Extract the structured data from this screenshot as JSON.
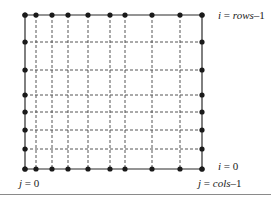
{
  "figure": {
    "type": "grid-lattice-diagram",
    "background_color": "#ffffff",
    "line_color": "#2b2b2b",
    "dashed_color": "#555555",
    "dot_color": "#1a1a1a",
    "dot_radius": 2.6,
    "solid_stroke_width": 1.2,
    "dashed_stroke_width": 1.0,
    "dash_pattern": "3,2",
    "bounds": {
      "left": 25,
      "top": 15,
      "right": 202,
      "bottom": 169
    },
    "column_x": [
      25,
      36,
      52,
      68,
      88,
      110,
      125,
      152,
      180,
      202
    ],
    "row_y": [
      15,
      42,
      70,
      95,
      112,
      130,
      149,
      169
    ]
  },
  "labels": {
    "top_right": {
      "name": "i-rows-minus-1",
      "var": "i",
      "eq": " = ",
      "expr": "rows",
      "suffix": "–1",
      "full_text": "i = rows–1"
    },
    "bottom_right_i": {
      "name": "i-equals-zero",
      "var": "i",
      "eq": " = ",
      "expr": "0",
      "suffix": "",
      "full_text": "i = 0"
    },
    "bottom_right_j": {
      "name": "j-cols-minus-1",
      "var": "j",
      "eq": " = ",
      "expr": "cols",
      "suffix": "–1",
      "full_text": "j = cols–1"
    },
    "bottom_left_j": {
      "name": "j-equals-zero",
      "var": "j",
      "eq": " = ",
      "expr": "0",
      "suffix": "",
      "full_text": "j = 0"
    }
  },
  "colors": {
    "ink": "#1a1a1a",
    "solid_line": "#2b2b2b",
    "dashed_line": "#555555",
    "rule": "#8a8a8a",
    "page": "#ffffff"
  }
}
